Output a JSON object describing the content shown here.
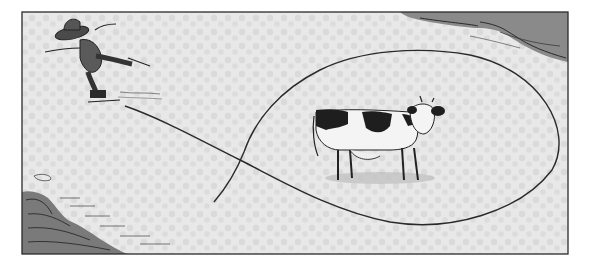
{
  "illustration": {
    "style": "pen-and-ink storybook illustration",
    "scene": "ice skater on a frozen pond looping a trail around a cow",
    "colors": {
      "paper": "#ffffff",
      "ice": "#e6e6e6",
      "ice_dots": "#d6d6d6",
      "ink": "#2a2a2a",
      "shadow_bank": "#7a7a7a",
      "cow_patch": "#1e1e1e",
      "cow_body": "#f4f4f4"
    },
    "elements": {
      "skater": "figure in wide sombrero-style hat skating on one leg, arms outstretched",
      "cow": "black-and-white spotted cow standing on the ice",
      "skate_trail": "curving line from skater looping in a large oval around the cow",
      "bank_top_right": "dark shaded snow bank in upper right corner",
      "bank_bottom_left": "dark shaded snow bank in lower left corner"
    }
  }
}
